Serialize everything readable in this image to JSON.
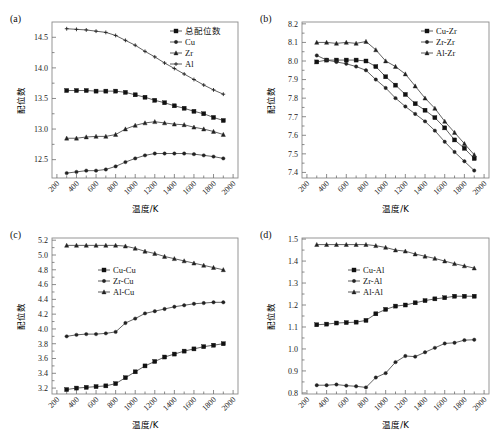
{
  "figure": {
    "axis_label_x": "温度/K",
    "axis_label_y": "配位数",
    "xlim": [
      150,
      2050
    ],
    "xticks": [
      200,
      400,
      600,
      800,
      1000,
      1200,
      1400,
      1600,
      1800,
      2000
    ],
    "colors": {
      "line": "#444444",
      "marker": "#111111",
      "frame": "#8a8a8a",
      "background": "#ffffff"
    }
  },
  "chart_data": [
    {
      "type": "line",
      "panel": "(a)",
      "title": "",
      "xlabel": "温度/K",
      "ylabel": "配位数",
      "xlim": [
        150,
        2050
      ],
      "ylim": [
        12.2,
        14.75
      ],
      "yticks": [
        12.5,
        13.0,
        13.5,
        14.0,
        14.5
      ],
      "ytick_labels": [
        "12.5",
        "13.0",
        "13.5",
        "14.0",
        "14.5"
      ],
      "xticks": [
        200,
        400,
        600,
        800,
        1000,
        1200,
        1400,
        1600,
        1800,
        2000
      ],
      "grid": false,
      "legend_position": "top-right",
      "x": [
        300,
        400,
        500,
        600,
        700,
        800,
        900,
        1000,
        1100,
        1200,
        1300,
        1400,
        1500,
        1600,
        1700,
        1800,
        1900
      ],
      "series": [
        {
          "name": "总配位数",
          "marker": "square-filled",
          "values": [
            13.63,
            13.63,
            13.63,
            13.62,
            13.62,
            13.62,
            13.6,
            13.56,
            13.52,
            13.47,
            13.43,
            13.38,
            13.34,
            13.29,
            13.25,
            13.19,
            13.14
          ]
        },
        {
          "name": "Cu",
          "marker": "circle-small",
          "values": [
            12.28,
            12.3,
            12.32,
            12.32,
            12.34,
            12.39,
            12.46,
            12.52,
            12.57,
            12.6,
            12.6,
            12.6,
            12.6,
            12.59,
            12.57,
            12.55,
            12.52
          ]
        },
        {
          "name": "Zr",
          "marker": "triangle-small",
          "values": [
            12.85,
            12.85,
            12.87,
            12.88,
            12.88,
            12.91,
            13.0,
            13.06,
            13.1,
            13.12,
            13.1,
            13.08,
            13.07,
            13.03,
            13.0,
            12.96,
            12.91
          ]
        },
        {
          "name": "Al",
          "marker": "plus-small",
          "values": [
            14.64,
            14.63,
            14.62,
            14.6,
            14.58,
            14.53,
            14.45,
            14.37,
            14.27,
            14.18,
            14.08,
            13.99,
            13.9,
            13.81,
            13.72,
            13.64,
            13.57
          ]
        }
      ]
    },
    {
      "type": "line",
      "panel": "(b)",
      "title": "",
      "xlabel": "温度/K",
      "ylabel": "配位数",
      "xlim": [
        150,
        2050
      ],
      "ylim": [
        7.37,
        8.21
      ],
      "yticks": [
        7.4,
        7.5,
        7.6,
        7.7,
        7.8,
        7.9,
        8.0,
        8.1,
        8.2
      ],
      "ytick_labels": [
        "7.4",
        "7.5",
        "7.6",
        "7.7",
        "7.8",
        "7.9",
        "8.0",
        "8.1",
        "8.2"
      ],
      "xticks": [
        200,
        400,
        600,
        800,
        1000,
        1200,
        1400,
        1600,
        1800,
        2000
      ],
      "grid": false,
      "legend_position": "top-right",
      "x": [
        300,
        400,
        500,
        600,
        700,
        800,
        900,
        1000,
        1100,
        1200,
        1300,
        1400,
        1500,
        1600,
        1700,
        1800,
        1900
      ],
      "series": [
        {
          "name": "Cu-Zr",
          "marker": "square-filled",
          "values": [
            7.995,
            8.005,
            8.005,
            8.005,
            8.005,
            8.0,
            7.97,
            7.915,
            7.87,
            7.82,
            7.77,
            7.735,
            7.695,
            7.64,
            7.575,
            7.53,
            7.475
          ]
        },
        {
          "name": "Zr-Zr",
          "marker": "circle-small",
          "values": [
            8.03,
            8.005,
            7.995,
            7.985,
            7.97,
            7.95,
            7.9,
            7.855,
            7.8,
            7.755,
            7.715,
            7.675,
            7.625,
            7.565,
            7.51,
            7.46,
            7.41
          ]
        },
        {
          "name": "Al-Zr",
          "marker": "triangle-small",
          "values": [
            8.1,
            8.1,
            8.095,
            8.1,
            8.095,
            8.105,
            8.06,
            8.0,
            7.97,
            7.93,
            7.865,
            7.8,
            7.745,
            7.675,
            7.615,
            7.555,
            7.495
          ]
        }
      ]
    },
    {
      "type": "line",
      "panel": "(c)",
      "title": "",
      "xlabel": "温度/K",
      "ylabel": "配位数",
      "xlim": [
        150,
        2050
      ],
      "ylim": [
        3.12,
        5.23
      ],
      "yticks": [
        3.2,
        3.4,
        3.6,
        3.8,
        4.0,
        4.2,
        4.4,
        4.6,
        4.8,
        5.0,
        5.2
      ],
      "ytick_labels": [
        "3.2",
        "3.4",
        "3.6",
        "3.8",
        "4.0",
        "4.2",
        "4.4",
        "4.6",
        "4.8",
        "5.0",
        "5.2"
      ],
      "xticks": [
        200,
        400,
        600,
        800,
        1000,
        1200,
        1400,
        1600,
        1800,
        2000
      ],
      "grid": false,
      "legend_position": "upper-center-left",
      "x": [
        300,
        400,
        500,
        600,
        700,
        800,
        900,
        1000,
        1100,
        1200,
        1300,
        1400,
        1500,
        1600,
        1700,
        1800,
        1900
      ],
      "series": [
        {
          "name": "Cu-Cu",
          "marker": "square-filled",
          "values": [
            3.18,
            3.2,
            3.21,
            3.22,
            3.23,
            3.26,
            3.34,
            3.42,
            3.5,
            3.56,
            3.62,
            3.66,
            3.7,
            3.73,
            3.76,
            3.78,
            3.8
          ]
        },
        {
          "name": "Zr-Cu",
          "marker": "circle-small",
          "values": [
            3.9,
            3.92,
            3.93,
            3.93,
            3.94,
            3.96,
            4.08,
            4.14,
            4.21,
            4.24,
            4.27,
            4.3,
            4.32,
            4.34,
            4.35,
            4.36,
            4.36
          ]
        },
        {
          "name": "Al-Cu",
          "marker": "triangle-small",
          "values": [
            5.13,
            5.13,
            5.13,
            5.13,
            5.13,
            5.13,
            5.12,
            5.09,
            5.05,
            5.02,
            4.98,
            4.95,
            4.92,
            4.89,
            4.86,
            4.83,
            4.8
          ]
        }
      ]
    },
    {
      "type": "line",
      "panel": "(d)",
      "title": "",
      "xlabel": "温度/K",
      "ylabel": "配位数",
      "xlim": [
        150,
        2050
      ],
      "ylim": [
        0.795,
        1.505
      ],
      "yticks": [
        0.8,
        0.9,
        1.0,
        1.1,
        1.2,
        1.3,
        1.4,
        1.5
      ],
      "ytick_labels": [
        "0.8",
        "0.9",
        "1.0",
        "1.1",
        "1.2",
        "1.3",
        "1.4",
        "1.5"
      ],
      "xticks": [
        200,
        400,
        600,
        800,
        1000,
        1200,
        1400,
        1600,
        1800,
        2000
      ],
      "grid": false,
      "legend_position": "upper-center-left",
      "x": [
        300,
        400,
        500,
        600,
        700,
        800,
        900,
        1000,
        1100,
        1200,
        1300,
        1400,
        1500,
        1600,
        1700,
        1800,
        1900
      ],
      "series": [
        {
          "name": "Cu-Al",
          "marker": "square-filled",
          "values": [
            1.11,
            1.113,
            1.118,
            1.12,
            1.122,
            1.13,
            1.16,
            1.18,
            1.195,
            1.2,
            1.21,
            1.22,
            1.228,
            1.233,
            1.24,
            1.24,
            1.24
          ]
        },
        {
          "name": "Zr-Al",
          "marker": "circle-small",
          "values": [
            0.835,
            0.835,
            0.838,
            0.833,
            0.83,
            0.825,
            0.87,
            0.89,
            0.94,
            0.968,
            0.965,
            0.985,
            1.005,
            1.025,
            1.028,
            1.04,
            1.042
          ]
        },
        {
          "name": "Al-Al",
          "marker": "triangle-small",
          "values": [
            1.475,
            1.475,
            1.475,
            1.475,
            1.475,
            1.475,
            1.47,
            1.462,
            1.45,
            1.445,
            1.432,
            1.422,
            1.412,
            1.4,
            1.388,
            1.378,
            1.368
          ]
        }
      ]
    }
  ]
}
